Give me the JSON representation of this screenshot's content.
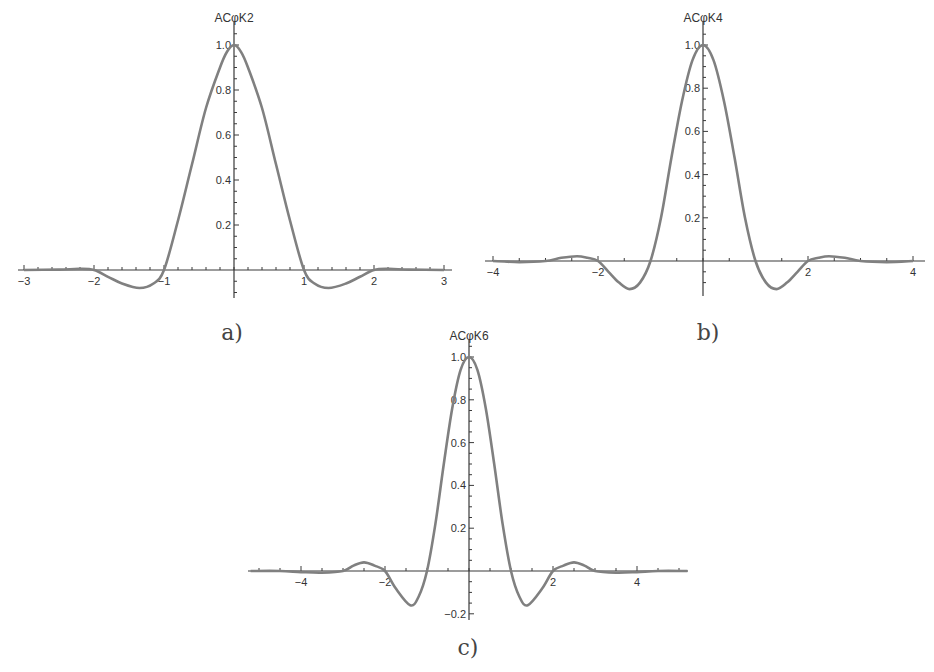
{
  "figure": {
    "captions": [
      "a)",
      "b)",
      "c)"
    ]
  },
  "chart_data": [
    {
      "type": "line",
      "title": "ACφK2",
      "caption": "a)",
      "xlabel": "",
      "ylabel": "ACφK2",
      "xlim": [
        -3,
        3
      ],
      "ylim": [
        -0.1,
        1.05
      ],
      "xticks": [
        -3,
        -2,
        -1,
        1,
        2,
        3
      ],
      "xtick_labels": [
        "-3",
        "-2",
        "-1",
        "1",
        "2",
        "3"
      ],
      "yticks": [
        0.2,
        0.4,
        0.6,
        0.8,
        1.0
      ],
      "ytick_labels": [
        "0.2",
        "0.4",
        "0.6",
        "0.8",
        "1.0"
      ],
      "grid": false,
      "series": [
        {
          "name": "ACφK2",
          "color": "#808080",
          "x": [
            -3,
            -2.5,
            -2.2,
            -2.0,
            -1.8,
            -1.6,
            -1.35,
            -1.15,
            -1.0,
            -0.8,
            -0.6,
            -0.4,
            -0.2,
            -0.1,
            0,
            0.1,
            0.2,
            0.4,
            0.6,
            0.8,
            1.0,
            1.15,
            1.35,
            1.6,
            1.8,
            2.0,
            2.2,
            2.5,
            3
          ],
          "y": [
            0,
            0.002,
            0.005,
            0,
            -0.03,
            -0.06,
            -0.08,
            -0.06,
            0,
            0.22,
            0.47,
            0.72,
            0.9,
            0.97,
            1.0,
            0.97,
            0.9,
            0.72,
            0.47,
            0.22,
            0,
            -0.06,
            -0.08,
            -0.06,
            -0.03,
            0,
            0.005,
            0.002,
            0
          ]
        }
      ]
    },
    {
      "type": "line",
      "title": "ACφK4",
      "caption": "b)",
      "xlabel": "",
      "ylabel": "ACφK4",
      "xlim": [
        -4,
        4
      ],
      "ylim": [
        -0.15,
        1.05
      ],
      "xticks": [
        -4,
        -2,
        2,
        4
      ],
      "xtick_labels": [
        "-4",
        "-2",
        "2",
        "4"
      ],
      "yticks": [
        0.2,
        0.4,
        0.6,
        0.8,
        1.0
      ],
      "ytick_labels": [
        "0.2",
        "0.4",
        "0.6",
        "0.8",
        "1.0"
      ],
      "grid": false,
      "series": [
        {
          "name": "ACφK4",
          "color": "#808080",
          "x": [
            -4,
            -3.5,
            -3.0,
            -2.7,
            -2.4,
            -2.2,
            -2.0,
            -1.8,
            -1.6,
            -1.4,
            -1.2,
            -1.0,
            -0.8,
            -0.6,
            -0.4,
            -0.2,
            0,
            0.2,
            0.4,
            0.6,
            0.8,
            1.0,
            1.2,
            1.4,
            1.6,
            1.8,
            2.0,
            2.2,
            2.4,
            2.7,
            3.0,
            3.5,
            4
          ],
          "y": [
            0,
            -0.005,
            0,
            0.015,
            0.022,
            0.015,
            0,
            -0.05,
            -0.1,
            -0.13,
            -0.1,
            0,
            0.2,
            0.48,
            0.74,
            0.93,
            1.0,
            0.93,
            0.74,
            0.48,
            0.2,
            0,
            -0.1,
            -0.13,
            -0.1,
            -0.05,
            0,
            0.015,
            0.022,
            0.015,
            0,
            -0.005,
            0
          ]
        }
      ]
    },
    {
      "type": "line",
      "title": "ACφK6",
      "caption": "c)",
      "xlabel": "",
      "ylabel": "ACφK6",
      "xlim": [
        -5.2,
        5.2
      ],
      "ylim": [
        -0.2,
        1.05
      ],
      "xticks": [
        -4,
        -2,
        2,
        4
      ],
      "xtick_labels": [
        "-4",
        "-2",
        "2",
        "4"
      ],
      "yticks": [
        -0.2,
        0.2,
        0.4,
        0.6,
        0.8,
        1.0
      ],
      "ytick_labels": [
        "-0.2",
        "0.2",
        "0.4",
        "0.6",
        "0.8",
        "1.0"
      ],
      "grid": false,
      "series": [
        {
          "name": "ACφK6",
          "color": "#808080",
          "x": [
            -5.2,
            -4.5,
            -4.0,
            -3.5,
            -3.0,
            -2.75,
            -2.5,
            -2.25,
            -2.0,
            -1.75,
            -1.4,
            -1.2,
            -1.0,
            -0.8,
            -0.6,
            -0.4,
            -0.2,
            0,
            0.2,
            0.4,
            0.6,
            0.8,
            1.0,
            1.2,
            1.4,
            1.75,
            2.0,
            2.25,
            2.5,
            2.75,
            3.0,
            3.5,
            4.0,
            4.5,
            5.2
          ],
          "y": [
            0,
            0,
            -0.005,
            -0.008,
            0,
            0.025,
            0.04,
            0.025,
            0,
            -0.08,
            -0.16,
            -0.12,
            0,
            0.22,
            0.5,
            0.76,
            0.94,
            1.0,
            0.94,
            0.76,
            0.5,
            0.22,
            0,
            -0.12,
            -0.16,
            -0.08,
            0,
            0.025,
            0.04,
            0.025,
            0,
            -0.008,
            -0.005,
            0,
            0
          ]
        }
      ]
    }
  ]
}
